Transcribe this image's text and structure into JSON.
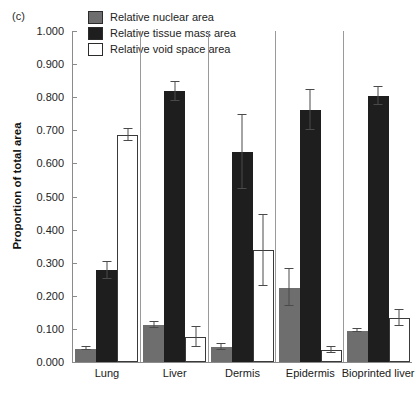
{
  "panel": {
    "label": "(c)"
  },
  "legend": {
    "items": [
      {
        "label": "Relative nuclear area",
        "color": "#6e6e6e",
        "border": "#2b2b2b",
        "icon": "legend-swatch-nuclear"
      },
      {
        "label": "Relative tissue mass area",
        "color": "#1e1e1e",
        "border": "#2b2b2b",
        "icon": "legend-swatch-tissue"
      },
      {
        "label": "Relative void space area",
        "color": "#ffffff",
        "border": "#2b2b2b",
        "icon": "legend-swatch-void"
      }
    ]
  },
  "axes": {
    "ylabel": "Proportion of total area",
    "yticks": [
      "0.000",
      "0.100",
      "0.200",
      "0.300",
      "0.400",
      "0.500",
      "0.600",
      "0.700",
      "0.800",
      "0.900",
      "1.000"
    ]
  },
  "chart_data": {
    "type": "bar",
    "title": "",
    "subtitle": "",
    "xlabel": "",
    "ylabel": "Proportion of total area",
    "ylim": [
      0.0,
      1.0
    ],
    "ytick_values": [
      0.0,
      0.1,
      0.2,
      0.3,
      0.4,
      0.5,
      0.6,
      0.7,
      0.8,
      0.9,
      1.0
    ],
    "grid": false,
    "legend_position": "top-center",
    "error_bars": "symmetric",
    "categories": [
      "Lung",
      "Liver",
      "Dermis",
      "Epidermis",
      "Bioprinted liver"
    ],
    "series": [
      {
        "name": "Relative nuclear area",
        "color": "#6e6e6e",
        "values": [
          0.04,
          0.113,
          0.046,
          0.225,
          0.095
        ],
        "errors": [
          0.005,
          0.009,
          0.009,
          0.055,
          0.004
        ]
      },
      {
        "name": "Relative tissue mass area",
        "color": "#1e1e1e",
        "values": [
          0.277,
          0.818,
          0.635,
          0.761,
          0.803
        ],
        "errors": [
          0.026,
          0.028,
          0.112,
          0.06,
          0.028
        ]
      },
      {
        "name": "Relative void space area",
        "color": "#ffffff",
        "values": [
          0.685,
          0.076,
          0.337,
          0.035,
          0.133
        ],
        "errors": [
          0.018,
          0.031,
          0.106,
          0.009,
          0.024
        ]
      }
    ]
  }
}
